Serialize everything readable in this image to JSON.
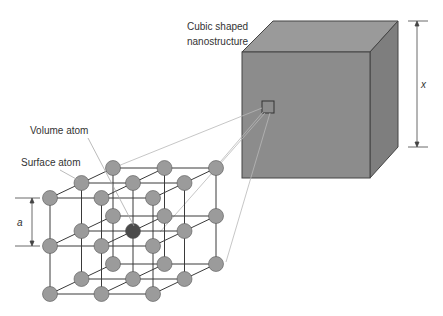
{
  "labels": {
    "cube_line1": "Cubic shaped",
    "cube_line2": "nanostructure",
    "volume_atom": "Volume atom",
    "surface_atom": "Surface atom",
    "lattice_spacing": "a",
    "cube_size": "x"
  },
  "colors": {
    "cube_front": "#8c8c8c",
    "cube_top": "#9a9a9a",
    "cube_side": "#7e7e7e",
    "atom": "#9b9b9b",
    "volume_atom": "#4a4a4a",
    "bond": "#3a3a3a",
    "leader": "#b8b8b8"
  },
  "lattice": {
    "layers": 3,
    "rows": 3,
    "cols": 3
  }
}
